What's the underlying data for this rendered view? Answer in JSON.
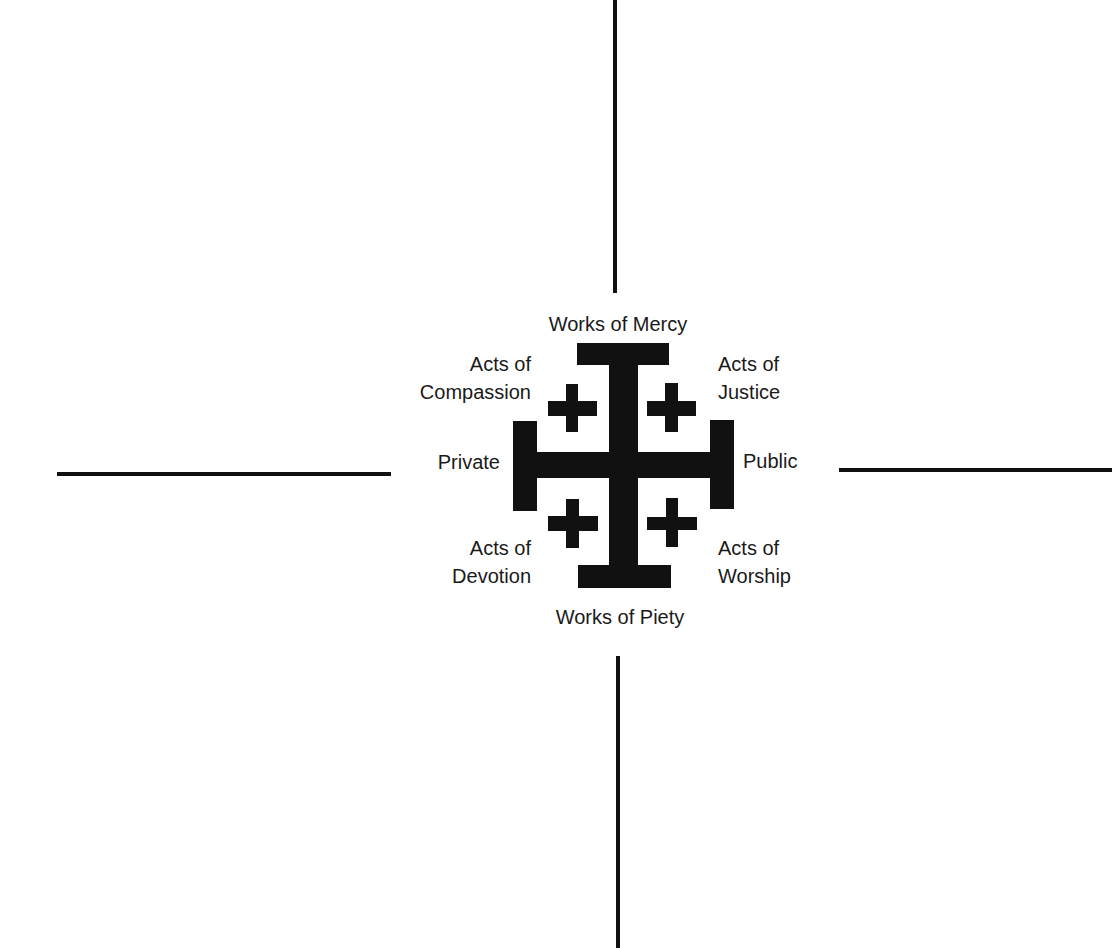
{
  "diagram": {
    "type": "quadrant-cross",
    "symbol": "jerusalem-cross",
    "colors": {
      "ink": "#111111",
      "text": "#1a1a1a",
      "background": "#ffffff"
    },
    "labels": {
      "top": "Works of Mercy",
      "bottom": "Works of Piety",
      "left": "Private",
      "right": "Public",
      "top_left": {
        "line1": "Acts of",
        "line2": "Compassion"
      },
      "top_right": {
        "line1": "Acts of",
        "line2": "Justice"
      },
      "bottom_left": {
        "line1": "Acts of",
        "line2": "Devotion"
      },
      "bottom_right": {
        "line1": "Acts of",
        "line2": "Worship"
      }
    },
    "axes": [
      {
        "name": "vertical-top",
        "x": 614,
        "y1": 0,
        "y2": 293
      },
      {
        "name": "vertical-bottom",
        "x": 617,
        "y1": 656,
        "y2": 948
      },
      {
        "name": "horizontal-left",
        "y": 472,
        "x1": 57,
        "x2": 391
      },
      {
        "name": "horizontal-right",
        "y": 468,
        "x1": 839,
        "x2": 1112
      }
    ]
  }
}
